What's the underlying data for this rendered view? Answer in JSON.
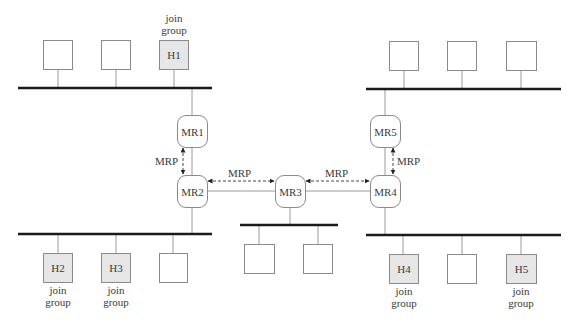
{
  "diagram": {
    "colors": {
      "bus": "#1a1a1a",
      "link": "#9a9a9a",
      "box_border": "#8a8a8a",
      "member_fill": "#e6e6e6",
      "text": "#3a3a3a",
      "arrow": "#222222"
    },
    "routers": [
      {
        "id": "MR1",
        "label": "MR1",
        "x": 177,
        "y": 115,
        "w": 30,
        "h": 32
      },
      {
        "id": "MR2",
        "label": "MR2",
        "x": 177,
        "y": 175,
        "w": 30,
        "h": 32
      },
      {
        "id": "MR3",
        "label": "MR3",
        "x": 275,
        "y": 175,
        "w": 30,
        "h": 32
      },
      {
        "id": "MR4",
        "label": "MR4",
        "x": 370,
        "y": 175,
        "w": 30,
        "h": 32
      },
      {
        "id": "MR5",
        "label": "MR5",
        "x": 370,
        "y": 115,
        "w": 30,
        "h": 32
      }
    ],
    "hosts": [
      {
        "id": "tl-1",
        "label": "",
        "member": false,
        "x": 43,
        "y": 40
      },
      {
        "id": "tl-2",
        "label": "",
        "member": false,
        "x": 101,
        "y": 40
      },
      {
        "id": "H1",
        "label": "H1",
        "member": true,
        "x": 159,
        "y": 40,
        "note": "join group",
        "note_pos": "above"
      },
      {
        "id": "tr-1",
        "label": "",
        "member": false,
        "x": 389,
        "y": 41
      },
      {
        "id": "tr-2",
        "label": "",
        "member": false,
        "x": 447,
        "y": 41
      },
      {
        "id": "tr-3",
        "label": "",
        "member": false,
        "x": 506,
        "y": 41
      },
      {
        "id": "H2",
        "label": "H2",
        "member": true,
        "x": 43,
        "y": 253,
        "note": "join group",
        "note_pos": "below"
      },
      {
        "id": "H3",
        "label": "H3",
        "member": true,
        "x": 101,
        "y": 253,
        "note": "join group",
        "note_pos": "below"
      },
      {
        "id": "bl-3",
        "label": "",
        "member": false,
        "x": 159,
        "y": 253
      },
      {
        "id": "m-1",
        "label": "",
        "member": false,
        "x": 244,
        "y": 244
      },
      {
        "id": "m-2",
        "label": "",
        "member": false,
        "x": 303,
        "y": 244
      },
      {
        "id": "H4",
        "label": "H4",
        "member": true,
        "x": 389,
        "y": 254,
        "note": "join group",
        "note_pos": "below"
      },
      {
        "id": "br-2",
        "label": "",
        "member": false,
        "x": 447,
        "y": 254
      },
      {
        "id": "H5",
        "label": "H5",
        "member": true,
        "x": 506,
        "y": 254,
        "note": "join group",
        "note_pos": "below"
      }
    ],
    "buses": [
      {
        "id": "top-left-lan",
        "x1": 18,
        "x2": 212,
        "y": 88
      },
      {
        "id": "top-right-lan",
        "x1": 366,
        "x2": 561,
        "y": 89
      },
      {
        "id": "bottom-left-lan",
        "x1": 18,
        "x2": 212,
        "y": 234
      },
      {
        "id": "middle-lan",
        "x1": 240,
        "x2": 338,
        "y": 225
      },
      {
        "id": "bottom-right-lan",
        "x1": 366,
        "x2": 561,
        "y": 235
      }
    ],
    "mrp_links": [
      {
        "from": "MR1",
        "to": "MR2",
        "label": "MRP",
        "orientation": "vertical"
      },
      {
        "from": "MR2",
        "to": "MR3",
        "label": "MRP",
        "orientation": "horizontal"
      },
      {
        "from": "MR3",
        "to": "MR4",
        "label": "MRP",
        "orientation": "horizontal"
      },
      {
        "from": "MR5",
        "to": "MR4",
        "label": "MRP",
        "orientation": "vertical"
      }
    ],
    "labels": {
      "join_line1": "join",
      "join_line2": "group",
      "mrp": "MRP"
    }
  }
}
